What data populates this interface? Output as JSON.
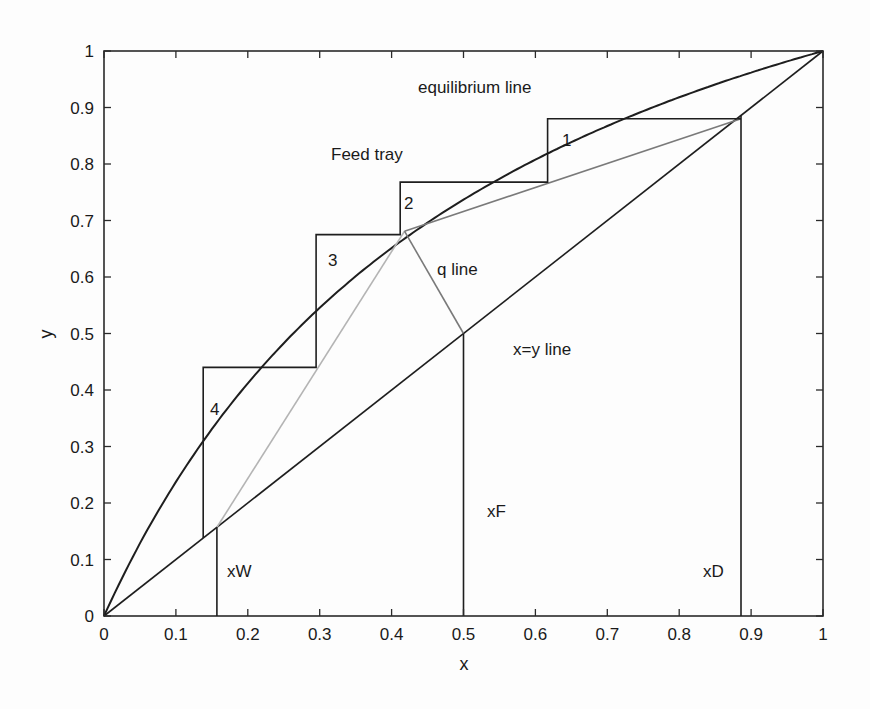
{
  "chart_data": {
    "type": "line",
    "title": "",
    "xlabel": "x",
    "ylabel": "y",
    "xlim": [
      0,
      1
    ],
    "ylim": [
      0,
      1
    ],
    "grid": false,
    "x_ticks": [
      "0",
      "0.1",
      "0.2",
      "0.3",
      "0.4",
      "0.5",
      "0.6",
      "0.7",
      "0.8",
      "0.9",
      "1"
    ],
    "y_ticks": [
      "0",
      "0.1",
      "0.2",
      "0.3",
      "0.4",
      "0.5",
      "0.6",
      "0.7",
      "0.8",
      "0.9",
      "1"
    ],
    "series": [
      {
        "name": "equilibrium line",
        "style": "black",
        "alpha": 2.8,
        "x": [
          0,
          0.05,
          0.1,
          0.138,
          0.2,
          0.295,
          0.35,
          0.412,
          0.5,
          0.617,
          0.7,
          0.8,
          0.9,
          1
        ],
        "y": [
          0,
          0.128,
          0.237,
          0.44,
          0.412,
          0.675,
          0.6,
          0.768,
          0.737,
          0.88,
          0.867,
          0.918,
          0.962,
          1
        ]
      },
      {
        "name": "x=y line",
        "style": "black",
        "x": [
          0,
          1
        ],
        "y": [
          0,
          1
        ]
      },
      {
        "name": "rectifying operating line",
        "style": "gray",
        "x": [
          0.418,
          0.886
        ],
        "y": [
          0.681,
          0.88
        ]
      },
      {
        "name": "stripping operating line",
        "style": "lightgray",
        "x": [
          0.157,
          0.418
        ],
        "y": [
          0.157,
          0.681
        ]
      },
      {
        "name": "q line",
        "style": "gray",
        "x": [
          0.5,
          0.418
        ],
        "y": [
          0.5,
          0.681
        ]
      },
      {
        "name": "stages",
        "style": "black",
        "x": [
          0.886,
          0.617,
          0.617,
          0.412,
          0.412,
          0.295,
          0.295,
          0.138,
          0.138
        ],
        "y": [
          0.88,
          0.88,
          0.768,
          0.768,
          0.675,
          0.675,
          0.44,
          0.44,
          0.138
        ]
      },
      {
        "name": "xD marker",
        "x": [
          0.886,
          0.886
        ],
        "y": [
          0,
          0.886
        ]
      },
      {
        "name": "xF marker",
        "x": [
          0.5,
          0.5
        ],
        "y": [
          0,
          0.5
        ]
      },
      {
        "name": "xW marker",
        "x": [
          0.157,
          0.157
        ],
        "y": [
          0,
          0.157
        ]
      }
    ],
    "annotations": [
      {
        "text": "equilibrium line",
        "x": 0.44,
        "y": 0.91
      },
      {
        "text": "Feed tray",
        "x": 0.32,
        "y": 0.81
      },
      {
        "text": "1",
        "x": 0.64,
        "y": 0.84
      },
      {
        "text": "2",
        "x": 0.42,
        "y": 0.73
      },
      {
        "text": "3",
        "x": 0.31,
        "y": 0.62
      },
      {
        "text": "4",
        "x": 0.15,
        "y": 0.37
      },
      {
        "text": "q line",
        "x": 0.46,
        "y": 0.61
      },
      {
        "text": "x=y line",
        "x": 0.57,
        "y": 0.49
      },
      {
        "text": "xF",
        "x": 0.53,
        "y": 0.19
      },
      {
        "text": "xW",
        "x": 0.17,
        "y": 0.06
      },
      {
        "text": "xD",
        "x": 0.82,
        "y": 0.06
      }
    ]
  },
  "labels": {
    "x_axis_title": "x",
    "y_axis_title": "y",
    "equilibrium": "equilibrium line",
    "feed_tray": "Feed tray",
    "stage1": "1",
    "stage2": "2",
    "stage3": "3",
    "stage4": "4",
    "q_line": "q line",
    "xy_line": "x=y line",
    "xF": "xF",
    "xW": "xW",
    "xD": "xD"
  }
}
